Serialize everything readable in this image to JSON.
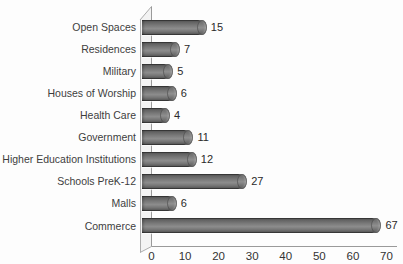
{
  "chart_data": {
    "type": "bar",
    "orientation": "horizontal",
    "style": "3d-cylinder",
    "title": "",
    "xlabel": "",
    "ylabel": "",
    "categories": [
      "Open Spaces",
      "Residences",
      "Military",
      "Houses of Worship",
      "Health Care",
      "Government",
      "Higher Education Institutions",
      "Schools PreK-12",
      "Malls",
      "Commerce"
    ],
    "values": [
      15,
      7,
      5,
      6,
      4,
      11,
      12,
      27,
      6,
      67
    ],
    "value_labels_shown": true,
    "xlim": [
      0,
      70
    ],
    "xticks": [
      0,
      10,
      20,
      30,
      40,
      50,
      60,
      70
    ],
    "grid": false,
    "legend": null
  },
  "colors": {
    "background": "#fdfdfd",
    "bar_body": "#7b7b7b",
    "bar_edge": "#4a4a4a",
    "axis_line": "#9a9a9a",
    "wall_edge": "#adadad",
    "wall_fill": "#f3f3f3",
    "text": "#333333"
  }
}
